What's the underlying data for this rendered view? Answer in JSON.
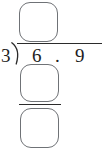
{
  "problem": {
    "type": "long-division",
    "divisor": "3",
    "dividend": "6.9",
    "dividend_whole": "6",
    "dividend_separator": ".",
    "dividend_decimal": "9",
    "expression": "3)6.9"
  },
  "boxes": {
    "quotient": {
      "label": "",
      "placeholder": ""
    },
    "work_1": {
      "label": "",
      "placeholder": ""
    },
    "work_2": {
      "label": "",
      "placeholder": ""
    }
  },
  "colors": {
    "ink": "#1d1d1d",
    "rule": "#2b2b2b",
    "box_outline": "#6f7276",
    "background": "#ffffff"
  }
}
